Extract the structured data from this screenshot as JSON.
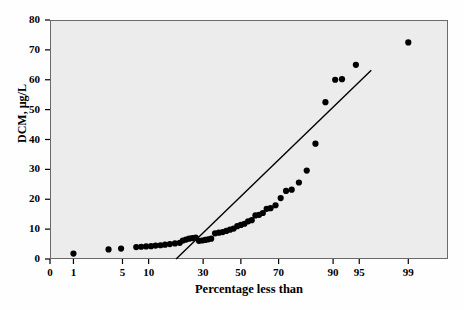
{
  "chart_data": {
    "type": "scatter",
    "title": "",
    "xlabel": "Percentage less than",
    "ylabel": "DCM, µg/L",
    "x_scale": "normal-probability",
    "ylim": [
      0,
      80
    ],
    "xlim": [
      0.4,
      99.8
    ],
    "grid": false,
    "legend": null,
    "yticks": [
      0,
      10,
      20,
      30,
      40,
      50,
      60,
      70,
      80
    ],
    "ytick_labels": [
      "0",
      "10",
      "20",
      "30",
      "40",
      "50",
      "60",
      "70",
      "80"
    ],
    "xticks": [
      0.4,
      1,
      5,
      10,
      30,
      50,
      70,
      90,
      95,
      99
    ],
    "xtick_labels": [
      "0",
      "1",
      "5",
      "10",
      "30",
      "50",
      "70",
      "90",
      "95",
      "99"
    ],
    "marker": {
      "shape": "circle",
      "color": "#000000",
      "size": 5
    },
    "series": [
      {
        "name": "DCM observations",
        "points": [
          [
            1.0,
            1.8
          ],
          [
            3.3,
            3.2
          ],
          [
            4.8,
            3.5
          ],
          [
            7.3,
            4.0
          ],
          [
            8.3,
            4.1
          ],
          [
            9.4,
            4.2
          ],
          [
            10.6,
            4.3
          ],
          [
            11.8,
            4.5
          ],
          [
            13.2,
            4.6
          ],
          [
            14.6,
            4.8
          ],
          [
            16.2,
            5.0
          ],
          [
            18.0,
            5.2
          ],
          [
            19.8,
            5.4
          ],
          [
            21.0,
            6.2
          ],
          [
            22.3,
            6.5
          ],
          [
            23.6,
            6.8
          ],
          [
            25.0,
            7.0
          ],
          [
            26.5,
            7.2
          ],
          [
            28.0,
            6.1
          ],
          [
            29.5,
            6.2
          ],
          [
            31.0,
            6.4
          ],
          [
            32.5,
            6.6
          ],
          [
            34.0,
            6.8
          ],
          [
            36.0,
            8.6
          ],
          [
            38.0,
            8.8
          ],
          [
            40.0,
            9.0
          ],
          [
            42.0,
            9.4
          ],
          [
            44.0,
            9.8
          ],
          [
            46.0,
            10.2
          ],
          [
            48.0,
            11.0
          ],
          [
            50.0,
            11.4
          ],
          [
            52.0,
            11.8
          ],
          [
            54.0,
            12.6
          ],
          [
            56.0,
            13.0
          ],
          [
            58.0,
            14.6
          ],
          [
            60.0,
            14.8
          ],
          [
            62.0,
            15.4
          ],
          [
            64.0,
            16.8
          ],
          [
            66.0,
            17.0
          ],
          [
            68.5,
            18.0
          ],
          [
            71.0,
            20.4
          ],
          [
            73.5,
            22.8
          ],
          [
            76.0,
            23.2
          ],
          [
            79.0,
            25.6
          ],
          [
            82.0,
            29.6
          ],
          [
            85.0,
            38.6
          ],
          [
            88.0,
            52.5
          ],
          [
            90.5,
            60.0
          ],
          [
            92.0,
            60.2
          ],
          [
            94.5,
            65.0
          ],
          [
            99.0,
            72.5
          ]
        ]
      }
    ],
    "fit_line": {
      "name": "reference line",
      "color": "#000000",
      "start": [
        18.4,
        0.0
      ],
      "end": [
        96.5,
        63.2
      ]
    }
  }
}
